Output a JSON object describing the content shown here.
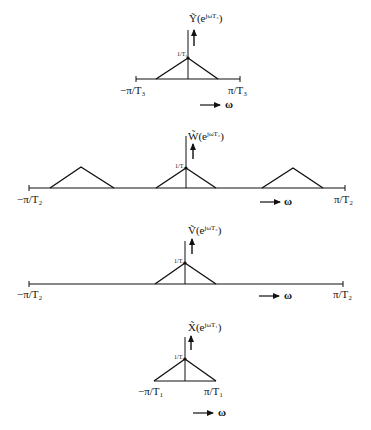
{
  "panels": [
    {
      "id": "Y",
      "title": "Ỹ(e^{jωT₃})",
      "title_main": "Ỹ(e",
      "title_sup": "jωT₃",
      "title_close": ")",
      "peak_label": "1/T₃",
      "left_label": "−π/T₃",
      "right_label": "π/T₃",
      "omega_label": "ω"
    },
    {
      "id": "W",
      "title": "W̃(e^{jωT₂})",
      "title_main": "W̃(e",
      "title_sup": "jωT₂",
      "title_close": ")",
      "peak_label": "1/T₂",
      "left_label": "−π/T₂",
      "right_label": "π/T₂",
      "omega_label": "ω"
    },
    {
      "id": "V",
      "title": "Ṽ(e^{jωT₂})",
      "title_main": "Ṽ(e",
      "title_sup": "jωT₂",
      "title_close": ")",
      "peak_label": "1/T₂",
      "left_label": "−π/T₂",
      "right_label": "π/T₂",
      "omega_label": "ω"
    },
    {
      "id": "X",
      "title": "X̃(e^{jωT₁})",
      "title_main": "X̃(e",
      "title_sup": "jωT₁",
      "title_close": ")",
      "peak_label": "1/T₁",
      "left_label": "−π/T₁",
      "right_label": "π/T₁",
      "omega_label": "ω"
    }
  ],
  "colors": {
    "ink": "#111111",
    "background": "#ffffff"
  }
}
